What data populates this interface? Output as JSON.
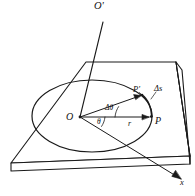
{
  "figure": {
    "background_color": "#ffffff",
    "stroke_color": "#1a1a1a",
    "labels": {
      "axis_top": "O'",
      "origin": "O",
      "point_p": "P",
      "point_p_prime": "P'",
      "arc_length": "Δs",
      "angle_delta": "Δθ",
      "angle_theta": "θ",
      "radius": "r",
      "axis_x": "x"
    }
  },
  "geometry": {
    "plate": {
      "type": "slab",
      "top_face_points": "86,62 176,62 190,156 11,163",
      "thickness_px": 6
    },
    "circle": {
      "type": "ellipse-perspective",
      "center": [
        80,
        117
      ],
      "rx": 60,
      "ry": 36
    },
    "vertical_axis": {
      "from": [
        103,
        23
      ],
      "to": [
        80,
        117
      ]
    },
    "radius_line": {
      "from": [
        80,
        117
      ],
      "to": [
        150,
        117
      ]
    },
    "p_prime_line": {
      "from": [
        80,
        117
      ],
      "to": [
        141,
        95
      ]
    },
    "x_axis_arrow": {
      "from": [
        80,
        117
      ],
      "to": [
        182,
        180
      ]
    }
  }
}
